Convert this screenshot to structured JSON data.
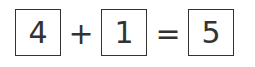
{
  "equation": {
    "operand1": "4",
    "operator": "+",
    "operand2": "1",
    "equals": "=",
    "result": "5"
  }
}
